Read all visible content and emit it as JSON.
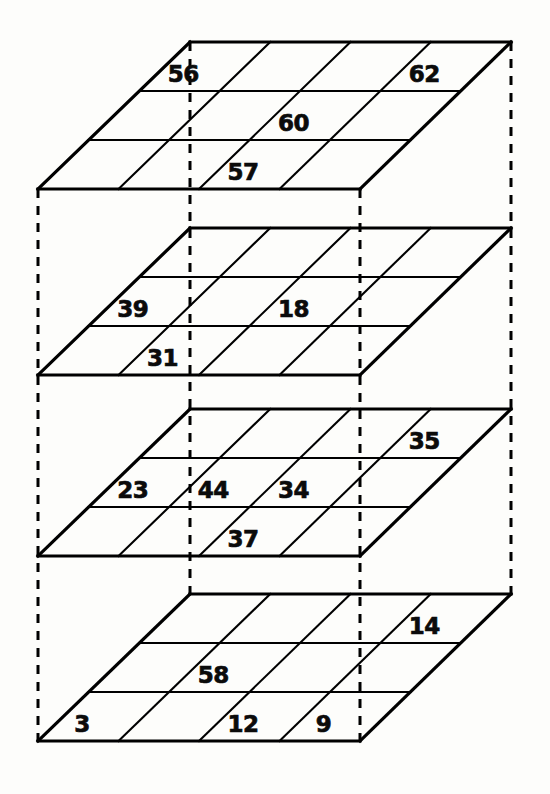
{
  "figure": {
    "type": "layered-grid-diagram",
    "background_color": "#fdfdfb",
    "line_color": "#000000",
    "label_color": "#0b0b0b",
    "layer_count": 4,
    "grid_columns": 4,
    "grid_rows": 3,
    "geometry": {
      "top_left_x": 190,
      "top_right_x": 511,
      "bottom_left_x": 38,
      "bottom_right_x": 360,
      "layer_tops": [
        42,
        228,
        409,
        594
      ],
      "layer_height": 147,
      "pillar_x": [
        38,
        190,
        360,
        511
      ]
    },
    "layers": [
      {
        "index": 0,
        "name": "layer-1-top",
        "labels": [
          {
            "value": "56",
            "row": 0,
            "col": 0
          },
          {
            "value": "62",
            "row": 0,
            "col": 3
          },
          {
            "value": "60",
            "row": 1,
            "col": 2
          },
          {
            "value": "57",
            "row": 2,
            "col": 2
          }
        ]
      },
      {
        "index": 1,
        "name": "layer-2",
        "labels": [
          {
            "value": "39",
            "row": 1,
            "col": 0
          },
          {
            "value": "18",
            "row": 1,
            "col": 2
          },
          {
            "value": "31",
            "row": 2,
            "col": 1
          }
        ]
      },
      {
        "index": 2,
        "name": "layer-3",
        "labels": [
          {
            "value": "35",
            "row": 0,
            "col": 3
          },
          {
            "value": "23",
            "row": 1,
            "col": 0
          },
          {
            "value": "44",
            "row": 1,
            "col": 1
          },
          {
            "value": "34",
            "row": 1,
            "col": 2
          },
          {
            "value": "37",
            "row": 2,
            "col": 2
          }
        ]
      },
      {
        "index": 3,
        "name": "layer-4-bottom",
        "labels": [
          {
            "value": "14",
            "row": 0,
            "col": 3
          },
          {
            "value": "58",
            "row": 1,
            "col": 1
          },
          {
            "value": "12",
            "row": 2,
            "col": 2
          },
          {
            "value": "3",
            "row": 2,
            "col": 0
          },
          {
            "value": "9",
            "row": 2,
            "col": 3
          }
        ]
      }
    ],
    "all_values": [
      "56",
      "62",
      "60",
      "57",
      "39",
      "18",
      "31",
      "35",
      "23",
      "44",
      "34",
      "37",
      "14",
      "58",
      "12",
      "3",
      "9"
    ]
  }
}
